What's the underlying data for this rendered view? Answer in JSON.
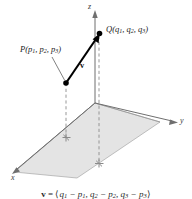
{
  "figure": {
    "kind": "3d-vector-diagram",
    "background_color": "#ffffff",
    "axes": {
      "x_label": "x",
      "y_label": "y",
      "z_label": "z",
      "axis_color": "#6f6f6f"
    },
    "plane": {
      "name": "xy-plane",
      "fill_color": "#e3e3e3",
      "edge_color": "#9a9a9a"
    },
    "points": [
      {
        "id": "P",
        "label_name": "P",
        "label_text": "P(p1, p2, p3)",
        "coord_names": [
          "p1",
          "p2",
          "p3"
        ],
        "dot_color": "#000000"
      },
      {
        "id": "Q",
        "label_name": "Q",
        "label_text": "Q(q1, q2, q3)",
        "coord_names": [
          "q1",
          "q2",
          "q3"
        ],
        "dot_color": "#000000"
      }
    ],
    "vector": {
      "label": "v",
      "from": "P",
      "to": "Q",
      "color": "#000000",
      "style": "solid-arrow"
    },
    "projection_lines": {
      "style": "dashed",
      "color": "#8d8d8d",
      "foot_marker": "cross-marker"
    },
    "caption": {
      "lhs": "v",
      "equals": " = ",
      "open": "⟨",
      "terms": [
        "q1 − p1",
        "q2 − p2",
        "q3 − p3"
      ],
      "close": "⟩",
      "full_text": "v = ⟨q1 − p1, q2 − p2, q3 − p3⟩"
    }
  }
}
